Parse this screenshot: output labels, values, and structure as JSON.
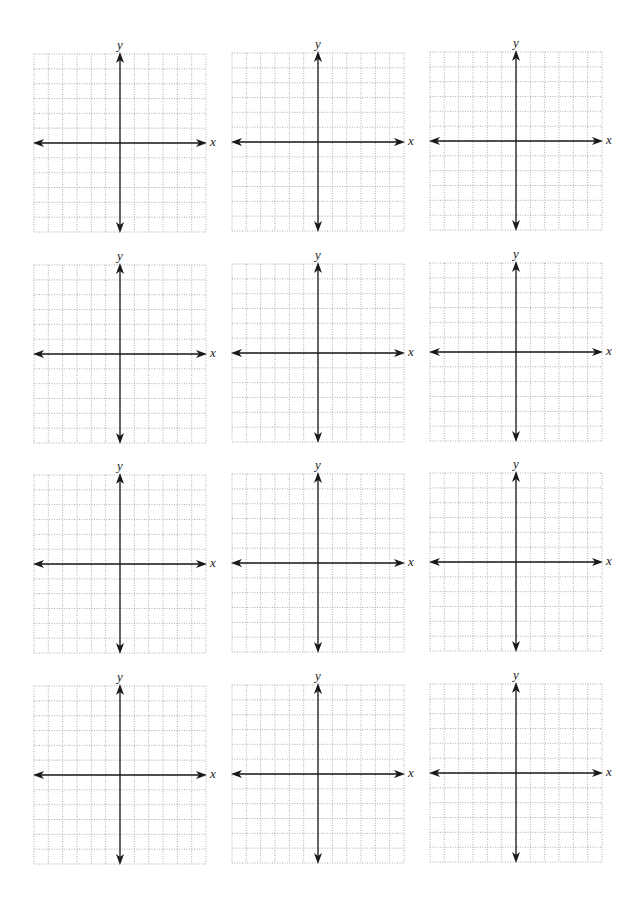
{
  "worksheet": {
    "rows": 4,
    "columns": 3,
    "grid": {
      "cells_x": 12,
      "cells_y": 12,
      "y_axis_col": 6,
      "x_axis_row": 6
    },
    "axis_labels": {
      "x": "x",
      "y": "y"
    },
    "colors": {
      "axis": "#1a1a1a",
      "grid": "#9a9a9a",
      "background": "#ffffff"
    },
    "graphs": [
      {
        "id": 1,
        "left": 34,
        "top": 54
      },
      {
        "id": 2,
        "left": 232,
        "top": 53
      },
      {
        "id": 3,
        "left": 430,
        "top": 52
      },
      {
        "id": 4,
        "left": 34,
        "top": 265
      },
      {
        "id": 5,
        "left": 232,
        "top": 264
      },
      {
        "id": 6,
        "left": 430,
        "top": 263
      },
      {
        "id": 7,
        "left": 34,
        "top": 475
      },
      {
        "id": 8,
        "left": 232,
        "top": 474
      },
      {
        "id": 9,
        "left": 430,
        "top": 473
      },
      {
        "id": 10,
        "left": 34,
        "top": 686
      },
      {
        "id": 11,
        "left": 232,
        "top": 685
      },
      {
        "id": 12,
        "left": 430,
        "top": 684
      }
    ]
  }
}
